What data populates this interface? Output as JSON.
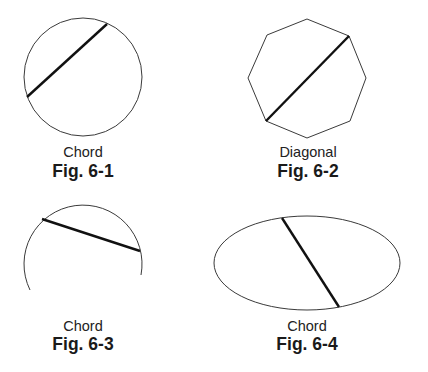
{
  "figures": [
    {
      "id": "fig-6-1",
      "shape": "circle",
      "caption": "Chord",
      "label": "Fig. 6-1",
      "geometry": {
        "cx": 83,
        "cy": 77,
        "r": 59
      },
      "segment": {
        "x1": 27,
        "y1": 97,
        "x2": 107,
        "y2": 24
      }
    },
    {
      "id": "fig-6-2",
      "shape": "octagon",
      "caption": "Diagonal",
      "label": "Fig. 6-2",
      "geometry": {
        "points": "307,19 349,36 366,78 350,121 307,138 266,121 248,78 267,35"
      },
      "segment": {
        "x1": 266,
        "y1": 121,
        "x2": 349,
        "y2": 36
      }
    },
    {
      "id": "fig-6-3",
      "shape": "arc",
      "caption": "Chord",
      "label": "Fig. 6-3",
      "geometry": {
        "d": "M 30 290 A 59 59 0 1 1 141 275"
      },
      "segment": {
        "x1": 42,
        "y1": 219,
        "x2": 140,
        "y2": 251
      }
    },
    {
      "id": "fig-6-4",
      "shape": "ellipse",
      "caption": "Chord",
      "label": "Fig. 6-4",
      "geometry": {
        "cx": 307,
        "cy": 263,
        "rx": 93,
        "ry": 47
      },
      "segment": {
        "x1": 282,
        "y1": 218,
        "x2": 339,
        "y2": 307
      }
    }
  ],
  "colors": {
    "outline": "#3a3a3a",
    "segment": "#111111",
    "text": "#1a1a1a",
    "background": "#ffffff"
  }
}
